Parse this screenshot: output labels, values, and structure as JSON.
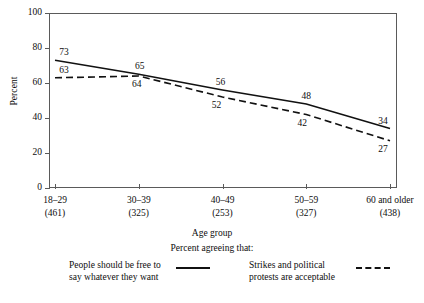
{
  "chart_data": {
    "type": "line",
    "title": "",
    "xlabel": "Age group",
    "ylabel": "Percent",
    "sub_caption": "Percent agreeing that:",
    "ylim": [
      0,
      100
    ],
    "yticks": [
      0,
      20,
      40,
      60,
      80,
      100
    ],
    "grid": false,
    "legend_position": "bottom",
    "categories": [
      "18–29",
      "30–39",
      "40–49",
      "50–59",
      "60 and older"
    ],
    "category_counts": [
      "(461)",
      "(325)",
      "(253)",
      "(327)",
      "(438)"
    ],
    "series": [
      {
        "name": "People should be free to say whatever they want",
        "name_line1": "People should be free to",
        "name_line2": "say whatever they want",
        "style": "solid",
        "color": "#111111",
        "values": [
          73,
          65,
          56,
          48,
          34
        ]
      },
      {
        "name": "Strikes and political protests are acceptable",
        "name_line1": "Strikes and political",
        "name_line2": "protests are acceptable",
        "style": "dashed",
        "color": "#111111",
        "values": [
          63,
          64,
          52,
          42,
          27
        ]
      }
    ]
  },
  "axes": {
    "y_label": "Percent",
    "x_label": "Age group",
    "sub_caption": "Percent agreeing that:",
    "y_tick_labels": [
      "100",
      "80",
      "60",
      "40",
      "20",
      "0"
    ]
  },
  "value_labels": {
    "solid": [
      "73",
      "65",
      "56",
      "48",
      "34"
    ],
    "dashed": [
      "63",
      "64",
      "52",
      "42",
      "27"
    ]
  },
  "legend": {
    "solid_label_line1": "People should be free to",
    "solid_label_line2": "say whatever they want",
    "dashed_label_line1": "Strikes and political",
    "dashed_label_line2": "protests are acceptable"
  }
}
